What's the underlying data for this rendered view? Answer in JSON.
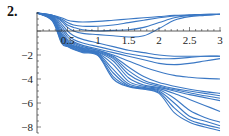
{
  "problem_label": "2.",
  "chart_data": {
    "type": "line",
    "title": "",
    "xlabel": "",
    "ylabel": "",
    "xlim": [
      0,
      3
    ],
    "ylim": [
      -8.5,
      1.8
    ],
    "grid": false,
    "legend": "none",
    "line_color": "#3b78c4",
    "x_ticks": [
      0.5,
      1,
      1.5,
      2,
      2.5,
      3
    ],
    "x_tick_labels": [
      "0.5",
      "1",
      "1.5",
      "2",
      "2.5",
      "3"
    ],
    "y_ticks": [
      -2,
      -4,
      -6,
      -8
    ],
    "y_tick_labels": [
      "-2",
      "-4",
      "-6",
      "-8"
    ],
    "x": [
      0,
      0.25,
      0.4,
      0.5,
      0.6,
      0.75,
      1.0,
      1.25,
      1.5,
      1.75,
      2.0,
      2.25,
      2.5,
      2.75,
      3.0
    ],
    "series": [
      {
        "name": "s1",
        "values": [
          1.5,
          1.3,
          1.1,
          0.9,
          0.8,
          0.75,
          0.8,
          0.9,
          1.0,
          1.1,
          1.2,
          1.3,
          1.35,
          1.4,
          1.4
        ]
      },
      {
        "name": "s2",
        "values": [
          1.5,
          1.3,
          1.0,
          0.7,
          0.5,
          0.4,
          0.4,
          0.5,
          0.7,
          0.9,
          1.1,
          1.25,
          1.3,
          1.35,
          1.4
        ]
      },
      {
        "name": "s3",
        "values": [
          1.5,
          1.3,
          0.9,
          0.5,
          0.3,
          0.1,
          0.0,
          0.05,
          0.1,
          0.3,
          0.7,
          1.1,
          1.3,
          1.35,
          1.4
        ]
      },
      {
        "name": "s4",
        "values": [
          1.5,
          1.3,
          0.8,
          0.3,
          0.0,
          -0.2,
          -0.3,
          -0.4,
          -0.5,
          -0.4,
          0.2,
          0.9,
          1.2,
          1.3,
          1.4
        ]
      },
      {
        "name": "s5",
        "values": [
          1.5,
          1.25,
          0.6,
          0.0,
          -0.4,
          -0.7,
          -1.0,
          -1.3,
          -1.6,
          -1.8,
          -2.0,
          -2.1,
          -2.1,
          -2.1,
          -2.1
        ]
      },
      {
        "name": "s6",
        "values": [
          1.5,
          1.2,
          0.4,
          -0.3,
          -0.7,
          -1.0,
          -1.3,
          -1.6,
          -1.9,
          -2.1,
          -2.3,
          -2.3,
          -2.2,
          -2.1,
          -2.1
        ]
      },
      {
        "name": "s7",
        "values": [
          1.5,
          1.2,
          0.2,
          -0.5,
          -0.9,
          -1.2,
          -1.5,
          -1.8,
          -2.1,
          -2.4,
          -2.7,
          -2.8,
          -2.7,
          -2.5,
          -2.3
        ]
      },
      {
        "name": "s8",
        "values": [
          1.5,
          1.15,
          0.0,
          -0.7,
          -1.0,
          -1.3,
          -1.6,
          -2.0,
          -2.5,
          -3.0,
          -3.4,
          -3.7,
          -3.85,
          -3.95,
          -4.0
        ]
      },
      {
        "name": "s9",
        "values": [
          1.5,
          1.1,
          -0.2,
          -0.8,
          -1.1,
          -1.4,
          -1.6,
          -2.1,
          -3.0,
          -3.8,
          -4.3,
          -4.6,
          -4.85,
          -5.05,
          -5.2
        ]
      },
      {
        "name": "s10",
        "values": [
          1.5,
          1.1,
          -0.3,
          -0.9,
          -1.2,
          -1.45,
          -1.7,
          -2.2,
          -3.3,
          -4.1,
          -4.5,
          -4.8,
          -5.0,
          -5.2,
          -5.4
        ]
      },
      {
        "name": "s11",
        "values": [
          1.5,
          1.05,
          -0.4,
          -1.0,
          -1.25,
          -1.5,
          -1.75,
          -2.3,
          -3.6,
          -4.3,
          -4.6,
          -4.9,
          -5.15,
          -5.4,
          -5.6
        ]
      },
      {
        "name": "s12",
        "values": [
          1.5,
          1.0,
          -0.5,
          -1.05,
          -1.3,
          -1.55,
          -1.8,
          -2.5,
          -3.9,
          -4.5,
          -4.7,
          -5.0,
          -5.3,
          -5.55,
          -5.8
        ]
      },
      {
        "name": "s13",
        "values": [
          1.5,
          1.0,
          -0.6,
          -1.1,
          -1.35,
          -1.6,
          -1.85,
          -2.8,
          -4.2,
          -4.6,
          -4.8,
          -5.2,
          -5.7,
          -6.2,
          -6.7
        ]
      },
      {
        "name": "s14",
        "values": [
          1.5,
          0.95,
          -0.7,
          -1.15,
          -1.4,
          -1.65,
          -1.9,
          -3.2,
          -4.4,
          -4.7,
          -4.9,
          -5.6,
          -6.6,
          -7.2,
          -7.6
        ]
      },
      {
        "name": "s15",
        "values": [
          1.5,
          0.9,
          -0.8,
          -1.2,
          -1.45,
          -1.7,
          -1.95,
          -3.5,
          -4.55,
          -4.75,
          -5.0,
          -6.0,
          -7.1,
          -7.5,
          -7.9
        ]
      },
      {
        "name": "s16",
        "values": [
          1.5,
          0.9,
          -0.9,
          -1.25,
          -1.5,
          -1.75,
          -2.0,
          -3.8,
          -4.6,
          -4.8,
          -5.1,
          -6.4,
          -7.4,
          -7.8,
          -8.1
        ]
      },
      {
        "name": "s17",
        "values": [
          1.5,
          0.85,
          -1.0,
          -1.3,
          -1.55,
          -1.8,
          -2.05,
          -4.0,
          -4.65,
          -4.85,
          -5.2,
          -6.8,
          -7.6,
          -8.0,
          -8.3
        ]
      }
    ]
  }
}
